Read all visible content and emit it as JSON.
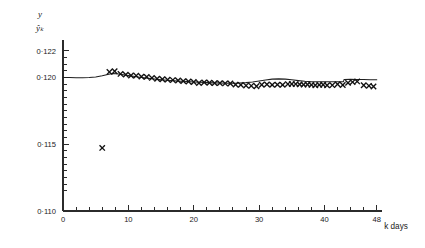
{
  "chart_data": {
    "type": "scatter",
    "title": "",
    "subtitle": "",
    "xlabel": "k days",
    "ylabel": "y",
    "ylabel_secondary": "ŷₖ",
    "xlim": [
      0,
      48.8
    ],
    "ylim": [
      0.11,
      0.1228
    ],
    "grid": false,
    "legend": null,
    "y_ticks_major": [
      {
        "value": 0.122,
        "label": "0·122"
      },
      {
        "value": 0.12,
        "label": "0·120"
      },
      {
        "value": 0.115,
        "label": "0·115"
      },
      {
        "value": 0.11,
        "label": "0·110"
      }
    ],
    "y_ticks_minor": [
      0.1215,
      0.121,
      0.1205,
      0.1195,
      0.119,
      0.1185,
      0.118,
      0.1175,
      0.117,
      0.1165,
      0.116,
      0.1155,
      0.1145,
      0.114,
      0.1135,
      0.113,
      0.1125,
      0.112,
      0.1115
    ],
    "x_ticks_major": [
      {
        "value": 0,
        "label": "0"
      },
      {
        "value": 10,
        "label": "10"
      },
      {
        "value": 20,
        "label": "20"
      },
      {
        "value": 30,
        "label": "30"
      },
      {
        "value": 40,
        "label": "40"
      },
      {
        "value": 48,
        "label": "48"
      }
    ],
    "x_ticks_minor": [
      2,
      4,
      6,
      8,
      12,
      14,
      16,
      18,
      22,
      24,
      26,
      28,
      32,
      34,
      36,
      38,
      42,
      44,
      46
    ],
    "series": [
      {
        "name": "fitted-line",
        "type": "line",
        "marker": "none",
        "color": "#1f1f1f",
        "x": [
          0.0,
          1.0,
          2.0,
          3.0,
          4.0,
          5.0,
          6.0,
          7.0,
          7.6,
          8.2,
          9.0,
          10.0,
          11.0,
          12.0,
          13.0,
          14.0,
          15.0,
          16.0,
          17.0,
          18.0,
          19.0,
          20.0,
          21.0,
          22.0,
          23.0,
          24.0,
          25.0,
          26.0,
          27.0,
          28.0,
          29.0,
          30.0,
          31.0,
          32.0,
          33.0,
          34.0,
          35.0,
          36.0,
          37.0,
          38.0,
          39.0,
          40.0,
          41.0,
          42.0,
          42.9,
          43.0,
          44.0,
          45.0,
          46.0,
          47.0,
          48.0
        ],
        "y": [
          0.11999,
          0.11999,
          0.11998,
          0.11998,
          0.11999,
          0.12003,
          0.12012,
          0.12024,
          0.12029,
          0.12028,
          0.12022,
          0.12014,
          0.12006,
          0.11999,
          0.11993,
          0.11988,
          0.11983,
          0.11979,
          0.11975,
          0.11972,
          0.11969,
          0.11966,
          0.11963,
          0.11961,
          0.11959,
          0.11958,
          0.11957,
          0.11957,
          0.11958,
          0.11961,
          0.11966,
          0.11973,
          0.11981,
          0.11987,
          0.11989,
          0.11987,
          0.11982,
          0.11976,
          0.11971,
          0.11968,
          0.11967,
          0.11967,
          0.11968,
          0.11968,
          0.11968,
          0.11985,
          0.11986,
          0.11985,
          0.11984,
          0.11983,
          0.11982
        ]
      },
      {
        "name": "observations",
        "type": "scatter",
        "marker": "x",
        "color": "#111111",
        "points": [
          {
            "k": 6.0,
            "y": 0.11472
          },
          {
            "k": 7.1,
            "y": 0.12041
          },
          {
            "k": 7.9,
            "y": 0.12046
          },
          {
            "k": 8.8,
            "y": 0.12026
          },
          {
            "k": 9.6,
            "y": 0.12021
          },
          {
            "k": 10.4,
            "y": 0.12014
          },
          {
            "k": 11.2,
            "y": 0.12013
          },
          {
            "k": 12.0,
            "y": 0.12006
          },
          {
            "k": 12.8,
            "y": 0.12004
          },
          {
            "k": 13.6,
            "y": 0.11996
          },
          {
            "k": 14.4,
            "y": 0.1199
          },
          {
            "k": 15.2,
            "y": 0.11986
          },
          {
            "k": 16.0,
            "y": 0.11983
          },
          {
            "k": 16.8,
            "y": 0.1198
          },
          {
            "k": 17.6,
            "y": 0.11977
          },
          {
            "k": 18.4,
            "y": 0.11972
          },
          {
            "k": 19.2,
            "y": 0.11969
          },
          {
            "k": 20.0,
            "y": 0.11966
          },
          {
            "k": 20.8,
            "y": 0.11958
          },
          {
            "k": 21.6,
            "y": 0.11963
          },
          {
            "k": 22.4,
            "y": 0.1196
          },
          {
            "k": 23.2,
            "y": 0.11957
          },
          {
            "k": 24.0,
            "y": 0.11957
          },
          {
            "k": 24.8,
            "y": 0.11955
          },
          {
            "k": 25.6,
            "y": 0.11954
          },
          {
            "k": 26.4,
            "y": 0.11946
          },
          {
            "k": 27.2,
            "y": 0.11944
          },
          {
            "k": 28.0,
            "y": 0.11939
          },
          {
            "k": 28.8,
            "y": 0.11937
          },
          {
            "k": 29.6,
            "y": 0.11934
          },
          {
            "k": 30.4,
            "y": 0.11945
          },
          {
            "k": 31.2,
            "y": 0.11948
          },
          {
            "k": 32.0,
            "y": 0.11944
          },
          {
            "k": 32.8,
            "y": 0.11946
          },
          {
            "k": 33.6,
            "y": 0.11944
          },
          {
            "k": 34.4,
            "y": 0.1195
          },
          {
            "k": 35.0,
            "y": 0.11951
          },
          {
            "k": 35.6,
            "y": 0.1195
          },
          {
            "k": 36.2,
            "y": 0.11948
          },
          {
            "k": 36.8,
            "y": 0.11946
          },
          {
            "k": 37.4,
            "y": 0.11947
          },
          {
            "k": 38.0,
            "y": 0.11944
          },
          {
            "k": 38.6,
            "y": 0.11941
          },
          {
            "k": 39.2,
            "y": 0.11944
          },
          {
            "k": 39.8,
            "y": 0.11945
          },
          {
            "k": 40.4,
            "y": 0.11941
          },
          {
            "k": 41.2,
            "y": 0.11942
          },
          {
            "k": 42.0,
            "y": 0.11949
          },
          {
            "k": 42.8,
            "y": 0.11943
          },
          {
            "k": 43.6,
            "y": 0.11959
          },
          {
            "k": 44.3,
            "y": 0.11965
          },
          {
            "k": 45.0,
            "y": 0.1197
          },
          {
            "k": 46.0,
            "y": 0.11941
          },
          {
            "k": 46.8,
            "y": 0.11937
          },
          {
            "k": 47.5,
            "y": 0.11932
          }
        ]
      }
    ]
  }
}
